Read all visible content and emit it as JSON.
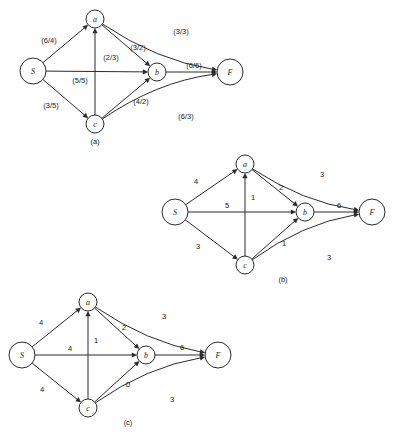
{
  "figure": {
    "background_color": "#ffffff",
    "stroke_color": "#2b2b2b",
    "text_color": "#1a1a1a"
  },
  "chart_data": {
    "type": "diagram",
    "diagram_type": "directed-network-flow-graph",
    "panel_count": 3,
    "title": "",
    "panels": [
      {
        "id": "a",
        "caption": "(a)",
        "caption_pos": {
          "x": 95,
          "y": 141
        },
        "label_format": "(capacity/flow)",
        "nodes": [
          {
            "id": "S",
            "label": "S",
            "x": 33,
            "y": 71,
            "r": 13
          },
          {
            "id": "a",
            "label": "a",
            "x": 95,
            "y": 19,
            "r": 9
          },
          {
            "id": "b",
            "label": "b",
            "x": 157,
            "y": 72,
            "r": 9
          },
          {
            "id": "c",
            "label": "c",
            "x": 95,
            "y": 124,
            "r": 9
          },
          {
            "id": "F",
            "label": "F",
            "x": 230,
            "y": 72,
            "r": 13
          }
        ],
        "edges": [
          {
            "from": "S",
            "to": "a",
            "label": "(6/4)",
            "lx": 49,
            "ly": 40
          },
          {
            "from": "S",
            "to": "b",
            "label": "(5/5)",
            "lx": 80,
            "ly": 80
          },
          {
            "from": "S",
            "to": "c",
            "label": "(3/5)",
            "lx": 51,
            "ly": 105
          },
          {
            "from": "c",
            "to": "a",
            "label": "(2/3)",
            "lx": 111,
            "ly": 57
          },
          {
            "from": "a",
            "to": "b",
            "label": "(3/2)",
            "lx": 138,
            "ly": 47
          },
          {
            "from": "c",
            "to": "b",
            "label": "(4/2)",
            "lx": 141,
            "ly": 101
          },
          {
            "from": "a",
            "to": "F",
            "label": "(3/3)",
            "lx": 181,
            "ly": 31
          },
          {
            "from": "b",
            "to": "F",
            "label": "(6/6)",
            "lx": 194,
            "ly": 65
          },
          {
            "from": "c",
            "to": "F",
            "label": "(6/3)",
            "lx": 186,
            "ly": 116
          }
        ]
      },
      {
        "id": "b",
        "caption": "(b)",
        "caption_pos": {
          "x": 283,
          "y": 279
        },
        "label_format": "capacity",
        "nodes": [
          {
            "id": "S",
            "label": "S",
            "x": 175,
            "y": 212,
            "r": 13
          },
          {
            "id": "a",
            "label": "a",
            "x": 245,
            "y": 164,
            "r": 9
          },
          {
            "id": "b",
            "label": "b",
            "x": 305,
            "y": 212,
            "r": 9
          },
          {
            "id": "c",
            "label": "c",
            "x": 245,
            "y": 265,
            "r": 9
          },
          {
            "id": "F",
            "label": "F",
            "x": 372,
            "y": 212,
            "r": 13
          }
        ],
        "edges": [
          {
            "from": "S",
            "to": "a",
            "label": "4",
            "lx": 196,
            "ly": 181
          },
          {
            "from": "S",
            "to": "b",
            "label": "5",
            "lx": 227,
            "ly": 205
          },
          {
            "from": "S",
            "to": "c",
            "label": "3",
            "lx": 198,
            "ly": 246
          },
          {
            "from": "c",
            "to": "a",
            "label": "1",
            "lx": 253,
            "ly": 197
          },
          {
            "from": "a",
            "to": "b",
            "label": "2",
            "lx": 281,
            "ly": 187
          },
          {
            "from": "c",
            "to": "b",
            "label": "1",
            "lx": 284,
            "ly": 243
          },
          {
            "from": "a",
            "to": "F",
            "label": "3",
            "lx": 322,
            "ly": 174
          },
          {
            "from": "b",
            "to": "F",
            "label": "6",
            "lx": 339,
            "ly": 205
          },
          {
            "from": "c",
            "to": "F",
            "label": "3",
            "lx": 329,
            "ly": 257
          }
        ]
      },
      {
        "id": "c",
        "caption": "(c)",
        "caption_pos": {
          "x": 128,
          "y": 422
        },
        "label_format": "residual",
        "nodes": [
          {
            "id": "S",
            "label": "S",
            "x": 22,
            "y": 355,
            "r": 13
          },
          {
            "id": "a",
            "label": "a",
            "x": 88,
            "y": 302,
            "r": 9
          },
          {
            "id": "b",
            "label": "b",
            "x": 146,
            "y": 355,
            "r": 9
          },
          {
            "id": "c",
            "label": "c",
            "x": 88,
            "y": 408,
            "r": 9
          },
          {
            "id": "F",
            "label": "F",
            "x": 218,
            "y": 355,
            "r": 13
          }
        ],
        "edges": [
          {
            "from": "S",
            "to": "a",
            "label": "4",
            "lx": 41,
            "ly": 322
          },
          {
            "from": "S",
            "to": "b",
            "label": "4",
            "lx": 70,
            "ly": 348
          },
          {
            "from": "S",
            "to": "c",
            "label": "4",
            "lx": 42,
            "ly": 389
          },
          {
            "from": "c",
            "to": "a",
            "label": "1",
            "lx": 96,
            "ly": 340
          },
          {
            "from": "a",
            "to": "b",
            "label": "2",
            "lx": 124,
            "ly": 327
          },
          {
            "from": "c",
            "to": "b",
            "label": "0",
            "lx": 128,
            "ly": 384
          },
          {
            "from": "a",
            "to": "F",
            "label": "3",
            "lx": 164,
            "ly": 316
          },
          {
            "from": "b",
            "to": "F",
            "label": "6",
            "lx": 182,
            "ly": 347
          },
          {
            "from": "c",
            "to": "F",
            "label": "3",
            "lx": 172,
            "ly": 399
          }
        ]
      }
    ]
  }
}
